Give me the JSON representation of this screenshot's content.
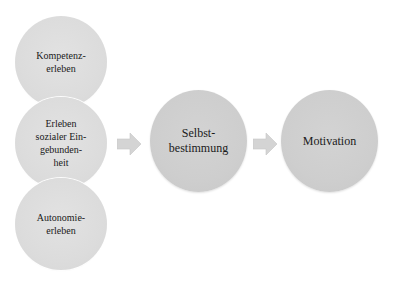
{
  "diagram": {
    "type": "flow",
    "inputs": [
      {
        "id": "kompetenz",
        "label": "Kompetenz-\nerleben"
      },
      {
        "id": "eingebundenheit",
        "label": "Erleben\nsozialer Ein-\ngebunden-\nheit"
      },
      {
        "id": "autonomie",
        "label": "Autonomie-\nerleben"
      }
    ],
    "middle": {
      "id": "selbstbestimmung",
      "label": "Selbst-\nbestimmung"
    },
    "output": {
      "id": "motivation",
      "label": "Motivation"
    },
    "connections": [
      {
        "from": "inputs",
        "to": "selbstbestimmung",
        "icon": "arrow-right-icon"
      },
      {
        "from": "selbstbestimmung",
        "to": "motivation",
        "icon": "arrow-right-icon"
      }
    ],
    "colors": {
      "input_fill": "#dcdcdc",
      "node_fill": "#cecece",
      "arrow_fill": "#d4d4d4",
      "text": "#1a1a1a",
      "background": "#ffffff"
    }
  }
}
